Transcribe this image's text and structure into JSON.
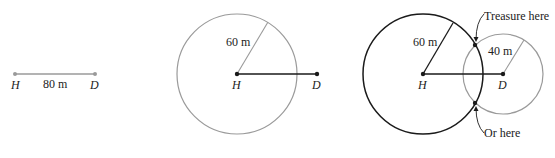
{
  "panel1": {
    "point_h": "H",
    "point_d": "D",
    "distance_label": "80 m"
  },
  "panel2": {
    "point_h": "H",
    "point_d": "D",
    "radius_label": "60 m"
  },
  "panel3": {
    "point_h": "H",
    "point_d": "D",
    "radius_h_label": "60 m",
    "radius_d_label": "40 m",
    "annotation_top": "Treasure here",
    "annotation_bottom": "Or here"
  },
  "colors": {
    "dark": "#1a1a1a",
    "gray": "#9a9a9a"
  }
}
